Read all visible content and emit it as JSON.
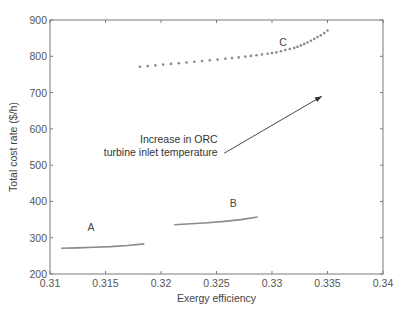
{
  "chart_data": {
    "type": "scatter",
    "title": "",
    "xlabel": "Exergy efficiency",
    "ylabel": "Total cost rate ($/h)",
    "xlim": [
      0.31,
      0.34
    ],
    "ylim": [
      200,
      900
    ],
    "xticks": [
      "0.31",
      "0.315",
      "0.32",
      "0.325",
      "0.33",
      "0.335",
      "0.34"
    ],
    "yticks": [
      "200",
      "300",
      "400",
      "500",
      "600",
      "700",
      "800",
      "900"
    ],
    "grid": false,
    "legend": null,
    "series": [
      {
        "name": "A",
        "style": "line",
        "color": "#8a8a8a",
        "x": [
          0.311,
          0.3125,
          0.314,
          0.3155,
          0.317,
          0.3185
        ],
        "y": [
          271,
          272,
          273.5,
          275.5,
          278.5,
          283
        ]
      },
      {
        "name": "B",
        "style": "line",
        "color": "#8a8a8a",
        "x": [
          0.3212,
          0.3227,
          0.3242,
          0.3257,
          0.3272,
          0.3287
        ],
        "y": [
          336,
          338.5,
          341.5,
          345,
          350,
          357
        ]
      },
      {
        "name": "C",
        "style": "dots",
        "color": "#8a8a8a",
        "x": [
          0.3181,
          0.3188,
          0.3195,
          0.3202,
          0.3209,
          0.3216,
          0.3223,
          0.323,
          0.3237,
          0.3244,
          0.3251,
          0.3258,
          0.3264,
          0.327,
          0.3276,
          0.3281,
          0.3286,
          0.3291,
          0.3296,
          0.33,
          0.3304,
          0.3308,
          0.3312,
          0.3316,
          0.332,
          0.3323,
          0.3326,
          0.3329,
          0.3332,
          0.3335,
          0.3338,
          0.3341,
          0.3344,
          0.3347,
          0.335
        ],
        "y": [
          771,
          773,
          775,
          777,
          779,
          781,
          783,
          785,
          787,
          789,
          791,
          793,
          795,
          797,
          799,
          801,
          803,
          805,
          807,
          809,
          811,
          814,
          817,
          820,
          823,
          826,
          830,
          834,
          838,
          843,
          848,
          853,
          858,
          864,
          871
        ]
      }
    ],
    "series_labels": [
      {
        "text": "A",
        "x": 0.3137,
        "y": 318
      },
      {
        "text": "B",
        "x": 0.3265,
        "y": 384
      },
      {
        "text": "C",
        "x": 0.331,
        "y": 828
      }
    ],
    "annotations": [
      {
        "lines": [
          "Increase in ORC",
          "turbine inlet temperature"
        ],
        "text_anchor": {
          "x": 0.3251,
          "y": 562
        },
        "arrow_from": {
          "x": 0.3257,
          "y": 533
        },
        "arrow_to": {
          "x": 0.3345,
          "y": 690
        }
      }
    ]
  },
  "labels": {
    "xlabel": "Exergy efficiency",
    "ylabel": "Total cost rate ($/h)",
    "annotation_line1": "Increase in ORC",
    "annotation_line2": "turbine inlet temperature",
    "series_a": "A",
    "series_b": "B",
    "series_c": "C"
  }
}
